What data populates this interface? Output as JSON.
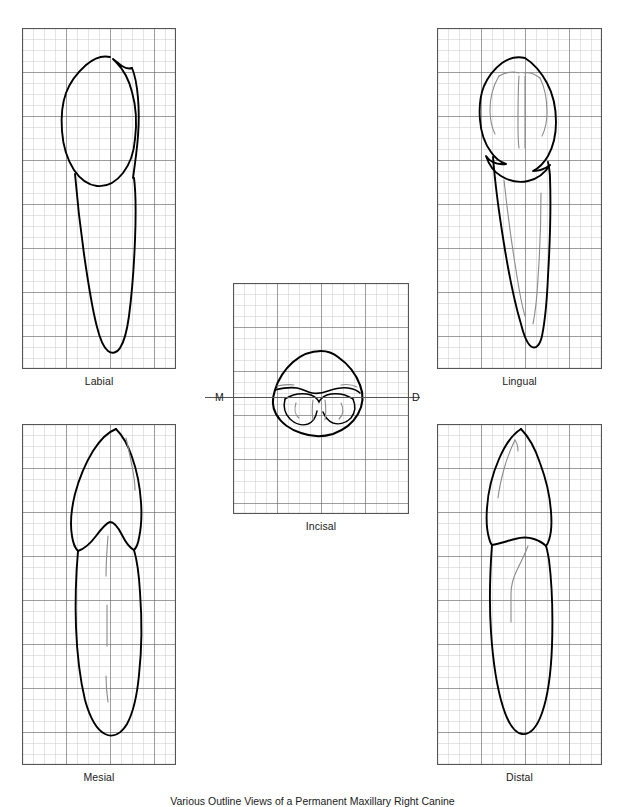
{
  "figure": {
    "caption": "Various Outline Views of a Permanent Maxillary Right Canine",
    "background_color": "#ffffff",
    "outline_color": "#000000",
    "detail_line_color": "#8a8a8a",
    "grid_minor_color": "#c9c9c9",
    "grid_major_color": "#555555",
    "grid_border_color": "#555555",
    "grid_cell_px": 11,
    "grid_major_every": 4
  },
  "panels": [
    {
      "id": "labial",
      "label": "Labial",
      "x": 22,
      "y": 28,
      "cols": 14,
      "rows": 31
    },
    {
      "id": "lingual",
      "label": "Lingual",
      "x": 437,
      "y": 28,
      "cols": 15,
      "rows": 31
    },
    {
      "id": "incisal",
      "label": "Incisal",
      "x": 233,
      "y": 283,
      "cols": 16,
      "rows": 21
    },
    {
      "id": "mesial",
      "label": "Mesial",
      "x": 22,
      "y": 424,
      "cols": 14,
      "rows": 31
    },
    {
      "id": "distal",
      "label": "Distal",
      "x": 437,
      "y": 424,
      "cols": 15,
      "rows": 31
    }
  ],
  "axis_markers": [
    {
      "id": "mesial-marker",
      "text": "M",
      "x": 215,
      "y": 394
    },
    {
      "id": "distal-marker",
      "text": "D",
      "x": 412,
      "y": 394
    }
  ]
}
